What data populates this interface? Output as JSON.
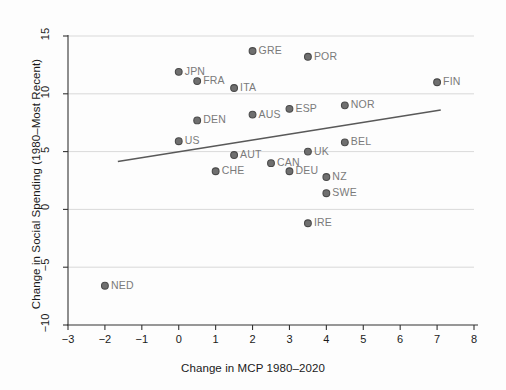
{
  "chart_data": {
    "type": "scatter",
    "title": "",
    "xlabel": "Change in MCP 1980–2020",
    "ylabel": "Change in Social Spending (1980–Most Recent)",
    "xlim": [
      -3,
      8
    ],
    "ylim": [
      -10,
      15
    ],
    "xticks": [
      "-3",
      "-2",
      "-1",
      "0",
      "1",
      "2",
      "3",
      "4",
      "5",
      "6",
      "7",
      "8"
    ],
    "xtick_values": [
      -3,
      -2,
      -1,
      0,
      1,
      2,
      3,
      4,
      5,
      6,
      7,
      8
    ],
    "yticks": [
      "15",
      "10",
      "5",
      "0",
      "-5",
      "-10"
    ],
    "ytick_values": [
      15,
      10,
      5,
      0,
      -5,
      -10
    ],
    "grid": "horizontal",
    "legend": "none",
    "marker_color": "#6f6f6f",
    "marker_edge_color": "#4a4a4a",
    "label_color": "#7a7a7a",
    "fit_line_color": "#595959",
    "fit_line": {
      "x_start": -1.65,
      "y_start": 4.15,
      "x_end": 7.1,
      "y_end": 8.6
    },
    "points": [
      {
        "label": "NED",
        "x": -2.0,
        "y": -6.6,
        "label_side": "right"
      },
      {
        "label": "JPN",
        "x": 0.0,
        "y": 11.9,
        "label_side": "right"
      },
      {
        "label": "US",
        "x": 0.0,
        "y": 5.9,
        "label_side": "right"
      },
      {
        "label": "FRA",
        "x": 0.5,
        "y": 11.1,
        "label_side": "right"
      },
      {
        "label": "DEN",
        "x": 0.5,
        "y": 7.7,
        "label_side": "right"
      },
      {
        "label": "CHE",
        "x": 1.0,
        "y": 3.3,
        "label_side": "right"
      },
      {
        "label": "ITA",
        "x": 1.5,
        "y": 10.5,
        "label_side": "right"
      },
      {
        "label": "AUT",
        "x": 1.5,
        "y": 4.7,
        "label_side": "right"
      },
      {
        "label": "GRE",
        "x": 2.0,
        "y": 13.7,
        "label_side": "right"
      },
      {
        "label": "AUS",
        "x": 2.0,
        "y": 8.2,
        "label_side": "right"
      },
      {
        "label": "CAN",
        "x": 2.5,
        "y": 4.0,
        "label_side": "right"
      },
      {
        "label": "ESP",
        "x": 3.0,
        "y": 8.7,
        "label_side": "right"
      },
      {
        "label": "DEU",
        "x": 3.0,
        "y": 3.3,
        "label_side": "right"
      },
      {
        "label": "POR",
        "x": 3.5,
        "y": 13.2,
        "label_side": "right"
      },
      {
        "label": "UK",
        "x": 3.5,
        "y": 5.0,
        "label_side": "right"
      },
      {
        "label": "IRE",
        "x": 3.5,
        "y": -1.2,
        "label_side": "right"
      },
      {
        "label": "NZ",
        "x": 4.0,
        "y": 2.8,
        "label_side": "right"
      },
      {
        "label": "SWE",
        "x": 4.0,
        "y": 1.4,
        "label_side": "right"
      },
      {
        "label": "NOR",
        "x": 4.5,
        "y": 9.0,
        "label_side": "right"
      },
      {
        "label": "BEL",
        "x": 4.5,
        "y": 5.8,
        "label_side": "right"
      },
      {
        "label": "FIN",
        "x": 7.0,
        "y": 11.0,
        "label_side": "right"
      }
    ]
  }
}
